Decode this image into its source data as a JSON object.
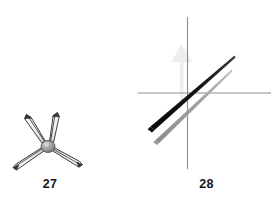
{
  "plate": {
    "name": "two-figure-line-drawing-plate",
    "background_color": "#ffffff",
    "width": 273,
    "height": 200
  },
  "figures": [
    {
      "id": "figure-27",
      "caption": "27",
      "description": "Tripod / jack-shaped object with a central hub and four tapered spear-like legs radiating outward",
      "ink_color": "#1a1a1a",
      "fill_color": "#f2f2f2",
      "hub_color": "#9a9a9a",
      "hub": {
        "cx": 48,
        "cy": 146,
        "rx": 6.5,
        "ry": 5.5
      },
      "legs": [
        {
          "name": "upper-left-leg",
          "tip_x": 27,
          "tip_y": 116
        },
        {
          "name": "upper-right-leg",
          "tip_x": 56,
          "tip_y": 113
        },
        {
          "name": "lower-left-leg",
          "tip_x": 14,
          "tip_y": 168
        },
        {
          "name": "lower-right-leg",
          "tip_x": 81,
          "tip_y": 164
        }
      ]
    },
    {
      "id": "figure-28",
      "caption": "28",
      "description": "Crosshair axes with a faint upward arrow and two parallel tapering diagonal bands",
      "axis_color": "#8f8f8f",
      "dark_band_color": "#111111",
      "light_band_color": "#9d9d9d",
      "ghost_arrow_color": "#e4e4e4",
      "origin": {
        "x": 188,
        "y": 93
      },
      "horizontal_axis": {
        "x1": 138,
        "x2": 271,
        "y": 93
      },
      "vertical_axis": {
        "x": 188,
        "y1": 17,
        "y2": 169
      },
      "ghost_arrow": {
        "tip_x": 180,
        "tip_y": 47,
        "base_y": 140
      },
      "dark_band": {
        "x1": 151,
        "y1": 126,
        "x2": 234,
        "y2": 56
      },
      "light_band": {
        "x1": 156,
        "y1": 140,
        "x2": 231,
        "y2": 69
      }
    }
  ]
}
